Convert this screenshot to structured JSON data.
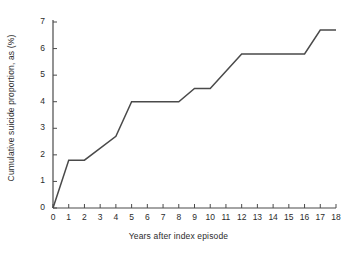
{
  "chart_data": {
    "type": "line",
    "title": "",
    "xlabel": "Years after index episode",
    "ylabel": "Cumulative suicide proportion, as (%)",
    "xlim": [
      0,
      18
    ],
    "ylim": [
      0,
      7
    ],
    "xticks": [
      0,
      1,
      2,
      3,
      4,
      5,
      6,
      7,
      8,
      9,
      10,
      11,
      12,
      13,
      14,
      15,
      16,
      17,
      18
    ],
    "xtick_labels": [
      "0",
      "1",
      "2",
      "3",
      "4",
      "5",
      "6",
      "7",
      "8",
      "9",
      "10",
      "11",
      "12",
      "13",
      "14",
      "15",
      "16",
      "17",
      "18"
    ],
    "yticks": [
      0,
      1,
      2,
      3,
      4,
      5,
      6,
      7
    ],
    "ytick_labels": [
      "0",
      "1",
      "2",
      "3",
      "4",
      "5",
      "6",
      "7"
    ],
    "grid": false,
    "legend": false,
    "line_color": "#4a4a4a",
    "line_width": 1.5,
    "series": [
      {
        "name": "Cumulative suicide proportion",
        "x": [
          0,
          1,
          2,
          4,
          5,
          8,
          9,
          10,
          12,
          16,
          17,
          18
        ],
        "values": [
          0.0,
          1.8,
          1.8,
          2.7,
          4.0,
          4.0,
          4.5,
          4.5,
          5.8,
          5.8,
          6.7,
          6.7
        ]
      }
    ]
  },
  "axis": {
    "x_title": "Years after index episode",
    "y_title": "Cumulative suicide proportion, as (%)"
  }
}
